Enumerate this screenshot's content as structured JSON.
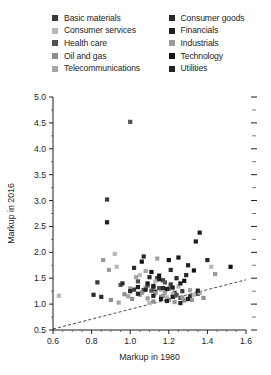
{
  "chart_data": {
    "type": "scatter",
    "title": "",
    "xlabel": "Markup in 1980",
    "ylabel": "Markup in 2016",
    "xlim": [
      0.6,
      1.6
    ],
    "ylim": [
      0.5,
      5.0
    ],
    "xticks": [
      0.6,
      0.8,
      1.0,
      1.2,
      1.4,
      1.6
    ],
    "xtick_labels": [
      "0.6",
      "0.8",
      "1.0",
      "1.2",
      "1.4",
      "1.6"
    ],
    "xminor_step": 0.05,
    "yticks": [
      0.5,
      1.0,
      1.5,
      2.0,
      2.5,
      3.0,
      3.5,
      4.0,
      4.5,
      5.0
    ],
    "ytick_labels": [
      "0.5",
      "1.0",
      "1.5",
      "2.0",
      "2.5",
      "3.0",
      "3.5",
      "4.0",
      "4.5",
      "5.0"
    ],
    "yminor_step": 0.25,
    "grid": false,
    "right_axis_ticks": true,
    "legend_position": "top",
    "trendline": {
      "style": "dashed",
      "color": "#333333",
      "x0": 0.6,
      "y0": 0.52,
      "x1": 1.6,
      "y1": 1.47
    },
    "legend": [
      {
        "name": "Basic materials",
        "color": "#3b3b3b"
      },
      {
        "name": "Consumer services",
        "color": "#b8b8b8"
      },
      {
        "name": "Health care",
        "color": "#515151"
      },
      {
        "name": "Oil and gas",
        "color": "#8e8e8e"
      },
      {
        "name": "Telecommunications",
        "color": "#a5a5a5"
      },
      {
        "name": "Consumer goods",
        "color": "#2a2a2a"
      },
      {
        "name": "Financials",
        "color": "#1f1f1f"
      },
      {
        "name": "Industrials",
        "color": "#9b9b9b"
      },
      {
        "name": "Technology",
        "color": "#151515"
      },
      {
        "name": "Utilities",
        "color": "#242424"
      }
    ],
    "series": [
      {
        "name": "Basic materials",
        "color": "#3b3b3b",
        "points": [
          [
            0.83,
            1.42
          ],
          [
            0.88,
            3.02
          ],
          [
            1.02,
            1.28
          ],
          [
            1.07,
            1.27
          ],
          [
            1.12,
            1.33
          ],
          [
            1.14,
            1.5
          ],
          [
            1.17,
            1.46
          ],
          [
            1.21,
            1.38
          ],
          [
            1.23,
            1.22
          ],
          [
            1.27,
            1.25
          ],
          [
            1.31,
            1.15
          ],
          [
            1.35,
            1.2
          ]
        ]
      },
      {
        "name": "Consumer services",
        "color": "#b8b8b8",
        "points": [
          [
            0.63,
            1.16
          ],
          [
            0.92,
            1.97
          ],
          [
            0.93,
            1.72
          ],
          [
            1.05,
            1.56
          ],
          [
            1.08,
            1.32
          ],
          [
            1.1,
            1.02
          ],
          [
            1.13,
            1.44
          ],
          [
            1.16,
            1.28
          ],
          [
            1.19,
            1.13
          ],
          [
            1.22,
            1.2
          ],
          [
            1.25,
            1.34
          ],
          [
            1.29,
            1.09
          ],
          [
            1.33,
            1.18
          ],
          [
            1.42,
            1.72
          ]
        ]
      },
      {
        "name": "Health care",
        "color": "#515151",
        "points": [
          [
            0.95,
            1.37
          ],
          [
            1.0,
            4.52
          ],
          [
            1.04,
            1.44
          ],
          [
            1.09,
            1.36
          ],
          [
            1.11,
            1.26
          ],
          [
            1.15,
            1.31
          ],
          [
            1.18,
            1.42
          ],
          [
            1.2,
            1.3
          ],
          [
            1.24,
            1.18
          ],
          [
            1.26,
            1.12
          ]
        ]
      },
      {
        "name": "Oil and gas",
        "color": "#8e8e8e",
        "points": [
          [
            0.9,
            1.08
          ],
          [
            0.97,
            1.19
          ],
          [
            1.01,
            1.1
          ],
          [
            1.06,
            1.22
          ],
          [
            1.12,
            1.05
          ],
          [
            1.16,
            1.14
          ],
          [
            1.2,
            1.08
          ],
          [
            1.28,
            1.07
          ],
          [
            1.38,
            1.12
          ]
        ]
      },
      {
        "name": "Telecommunications",
        "color": "#a5a5a5",
        "points": [
          [
            0.94,
            1.03
          ],
          [
            0.99,
            1.15
          ],
          [
            1.03,
            1.52
          ],
          [
            1.08,
            1.64
          ],
          [
            1.14,
            1.88
          ],
          [
            1.18,
            1.22
          ],
          [
            1.31,
            1.27
          ],
          [
            1.36,
            1.22
          ]
        ]
      },
      {
        "name": "Consumer goods",
        "color": "#2a2a2a",
        "points": [
          [
            0.81,
            1.18
          ],
          [
            0.85,
            1.14
          ],
          [
            0.96,
            1.4
          ],
          [
            1.02,
            1.7
          ],
          [
            1.07,
            1.92
          ],
          [
            1.1,
            1.52
          ],
          [
            1.13,
            1.24
          ],
          [
            1.17,
            1.31
          ],
          [
            1.21,
            1.66
          ],
          [
            1.24,
            1.5
          ],
          [
            1.29,
            1.56
          ],
          [
            1.4,
            1.85
          ]
        ]
      },
      {
        "name": "Financials",
        "color": "#1f1f1f",
        "points": [
          [
            0.88,
            2.58
          ],
          [
            1.04,
            1.33
          ],
          [
            1.09,
            1.4
          ],
          [
            1.12,
            1.35
          ],
          [
            1.15,
            1.48
          ],
          [
            1.19,
            1.29
          ],
          [
            1.22,
            1.32
          ],
          [
            1.26,
            1.4
          ],
          [
            1.3,
            1.75
          ],
          [
            1.34,
            2.21
          ],
          [
            1.36,
            2.38
          ]
        ]
      },
      {
        "name": "Industrials",
        "color": "#9b9b9b",
        "points": [
          [
            0.86,
            1.85
          ],
          [
            0.89,
            1.66
          ],
          [
            1.0,
            1.3
          ],
          [
            1.05,
            1.18
          ],
          [
            1.09,
            1.11
          ],
          [
            1.13,
            1.21
          ],
          [
            1.17,
            1.16
          ],
          [
            1.23,
            1.04
          ],
          [
            1.27,
            1.13
          ],
          [
            1.32,
            1.08
          ],
          [
            1.44,
            1.58
          ]
        ]
      },
      {
        "name": "Technology",
        "color": "#151515",
        "points": [
          [
            1.06,
            1.82
          ],
          [
            1.11,
            1.62
          ],
          [
            1.15,
            1.55
          ],
          [
            1.2,
            1.85
          ],
          [
            1.25,
            1.9
          ],
          [
            1.28,
            1.45
          ],
          [
            1.33,
            1.65
          ],
          [
            1.52,
            1.72
          ]
        ]
      },
      {
        "name": "Utilities",
        "color": "#242424",
        "points": [
          [
            1.0,
            1.25
          ],
          [
            1.04,
            1.2
          ],
          [
            1.08,
            1.28
          ],
          [
            1.12,
            1.16
          ],
          [
            1.16,
            1.1
          ],
          [
            1.19,
            1.06
          ],
          [
            1.22,
            1.14
          ],
          [
            1.26,
            1.02
          ],
          [
            1.3,
            1.1
          ],
          [
            1.35,
            1.26
          ]
        ]
      }
    ]
  }
}
